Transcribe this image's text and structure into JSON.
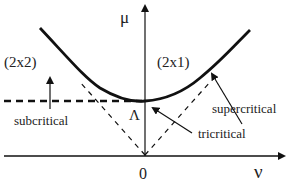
{
  "diagram": {
    "axes": {
      "x_label": "ν",
      "y_label": "μ",
      "origin_label": "0"
    },
    "regions": {
      "left": "(2x2)",
      "right": "(2x1)"
    },
    "point_label": "Λ",
    "annotations": {
      "subcritical": "subcritical",
      "supercritical": "supercritical",
      "tricritical": "tricritical"
    },
    "colors": {
      "line": "#111111",
      "background": "#ffffff"
    }
  }
}
